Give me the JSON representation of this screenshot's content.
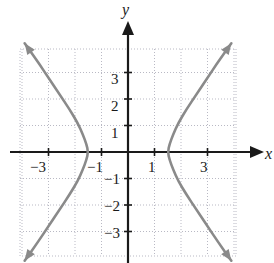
{
  "figure": {
    "title": "",
    "width": 274,
    "height": 263,
    "background_color": "#ffffff"
  },
  "axis_labels": {
    "y": "y",
    "x": "x"
  },
  "ticks": {
    "x_negative": [
      "−3",
      "−1"
    ],
    "x_positive": [
      "1",
      "3"
    ],
    "y_positive": [
      "3",
      "2",
      "1"
    ],
    "y_negative": [
      "−1",
      "−2",
      "−3"
    ]
  },
  "tick_values": {
    "x": [
      -3,
      -1,
      1,
      3
    ],
    "y": [
      3,
      2,
      1,
      -1,
      -2,
      -3
    ]
  },
  "colors": {
    "curve": "#8a8a8a",
    "axis": "#1a1a1a",
    "grid": "#b9b9c4",
    "text": "#1a1a1a",
    "background": "#ffffff"
  },
  "chart_data": {
    "type": "line",
    "title": "",
    "xlabel": "x",
    "ylabel": "y",
    "xlim": [
      -4.3,
      4.3
    ],
    "ylim": [
      -4.3,
      4.3
    ],
    "grid": true,
    "legend": null,
    "xticks": [
      -3,
      -1,
      1,
      3
    ],
    "yticks": [
      -3,
      -2,
      -1,
      1,
      2,
      3
    ],
    "xtick_labels": [
      "−3",
      "−1",
      "1",
      "3"
    ],
    "ytick_labels": [
      "−3",
      "−2",
      "−1",
      "1",
      "2",
      "3"
    ],
    "series": [
      {
        "name": "left-branch",
        "arrow_start": true,
        "arrow_end": true,
        "points": [
          [
            -3.9,
            4.1
          ],
          [
            -3.4,
            3.4
          ],
          [
            -3.0,
            2.8
          ],
          [
            -2.6,
            2.2
          ],
          [
            -2.2,
            1.6
          ],
          [
            -1.9,
            1.1
          ],
          [
            -1.7,
            0.65
          ],
          [
            -1.57,
            0.3
          ],
          [
            -1.5,
            0.0
          ],
          [
            -1.57,
            -0.3
          ],
          [
            -1.7,
            -0.65
          ],
          [
            -1.9,
            -1.1
          ],
          [
            -2.2,
            -1.6
          ],
          [
            -2.6,
            -2.2
          ],
          [
            -3.0,
            -2.8
          ],
          [
            -3.4,
            -3.4
          ],
          [
            -3.9,
            -4.1
          ]
        ]
      },
      {
        "name": "right-branch",
        "arrow_start": true,
        "arrow_end": true,
        "points": [
          [
            3.9,
            4.1
          ],
          [
            3.4,
            3.4
          ],
          [
            3.0,
            2.8
          ],
          [
            2.6,
            2.2
          ],
          [
            2.2,
            1.6
          ],
          [
            1.9,
            1.1
          ],
          [
            1.7,
            0.65
          ],
          [
            1.57,
            0.3
          ],
          [
            1.5,
            0.0
          ],
          [
            1.57,
            -0.3
          ],
          [
            1.7,
            -0.65
          ],
          [
            1.9,
            -1.1
          ],
          [
            2.2,
            -1.6
          ],
          [
            2.6,
            -2.2
          ],
          [
            3.0,
            -2.8
          ],
          [
            3.4,
            -3.4
          ],
          [
            3.9,
            -4.1
          ]
        ]
      }
    ]
  }
}
